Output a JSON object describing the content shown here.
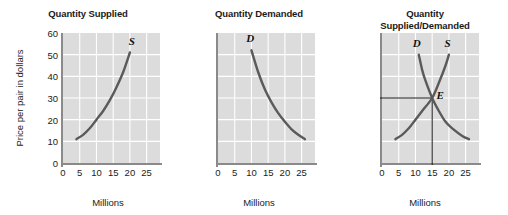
{
  "figure": {
    "background": "#ffffff",
    "plot_background": "#dcdcdc",
    "gridline_color": "#ffffff",
    "curve_color": "#5a5a5a",
    "axis_color": "#8a8a8a",
    "text_color": "#1b1b1b"
  },
  "axes": {
    "ylabel": "Price per pair in dollars",
    "xlabel": "Millions",
    "yticks": [
      "60",
      "50",
      "40",
      "30",
      "20",
      "10",
      "0"
    ],
    "ytick_values": [
      60,
      50,
      40,
      30,
      20,
      10,
      0
    ],
    "xticks": [
      "0",
      "5",
      "10",
      "15",
      "20",
      "25"
    ],
    "xtick_values": [
      0,
      5,
      10,
      15,
      20,
      25
    ],
    "xlim": [
      0,
      29
    ],
    "ylim": [
      0,
      60
    ]
  },
  "panels": [
    {
      "id": "quantity-supplied",
      "title_lines": [
        "Quantity Supplied"
      ],
      "show_yticks": true,
      "show_ylabel": true,
      "curve_labels": [
        {
          "text": "S",
          "x": 20.6,
          "y": 56.5
        }
      ],
      "equilibrium": null
    },
    {
      "id": "quantity-demanded",
      "title_lines": [
        "Quantity Demanded"
      ],
      "show_yticks": false,
      "show_ylabel": false,
      "curve_labels": [
        {
          "text": "D",
          "x": 9.6,
          "y": 57.5
        }
      ],
      "equilibrium": null
    },
    {
      "id": "quantity-supplied-demanded",
      "title_lines": [
        "Quantity",
        "Supplied/Demanded"
      ],
      "show_yticks": false,
      "show_ylabel": false,
      "curve_labels": [
        {
          "text": "D",
          "x": 10.4,
          "y": 55.5
        },
        {
          "text": "S",
          "x": 19.6,
          "y": 55.5
        },
        {
          "text": "E",
          "x": 17.4,
          "y": 31.5
        }
      ],
      "equilibrium": {
        "x": 15,
        "y": 30,
        "label": "E"
      }
    }
  ],
  "chart_data": {
    "type": "line",
    "xlabel": "Millions",
    "ylabel": "Price per pair in dollars",
    "xlim": [
      0,
      29
    ],
    "ylim": [
      0,
      60
    ],
    "xticks": [
      0,
      5,
      10,
      15,
      20,
      25
    ],
    "yticks": [
      0,
      10,
      20,
      30,
      40,
      50,
      60
    ],
    "grid": true,
    "legend": "none",
    "panels": [
      {
        "title": "Quantity Supplied",
        "series": [
          {
            "name": "S",
            "label": "S",
            "type": "supply",
            "points": [
              {
                "x": 4,
                "y": 11
              },
              {
                "x": 6,
                "y": 13
              },
              {
                "x": 8,
                "y": 16
              },
              {
                "x": 10,
                "y": 20
              },
              {
                "x": 12,
                "y": 24
              },
              {
                "x": 14,
                "y": 29
              },
              {
                "x": 16,
                "y": 35
              },
              {
                "x": 18,
                "y": 42
              },
              {
                "x": 20,
                "y": 51
              }
            ]
          }
        ]
      },
      {
        "title": "Quantity Demanded",
        "series": [
          {
            "name": "D",
            "label": "D",
            "type": "demand",
            "points": [
              {
                "x": 10,
                "y": 52
              },
              {
                "x": 12,
                "y": 42
              },
              {
                "x": 14,
                "y": 34
              },
              {
                "x": 16,
                "y": 28
              },
              {
                "x": 18,
                "y": 23
              },
              {
                "x": 20,
                "y": 19
              },
              {
                "x": 22,
                "y": 15.5
              },
              {
                "x": 24,
                "y": 13
              },
              {
                "x": 26,
                "y": 11
              }
            ]
          }
        ]
      },
      {
        "title": "Quantity Supplied/Demanded",
        "series": [
          {
            "name": "D",
            "label": "D",
            "type": "demand",
            "points": [
              {
                "x": 11,
                "y": 50
              },
              {
                "x": 12,
                "y": 43
              },
              {
                "x": 13,
                "y": 38
              },
              {
                "x": 15,
                "y": 30
              },
              {
                "x": 17,
                "y": 24
              },
              {
                "x": 19,
                "y": 19
              },
              {
                "x": 21,
                "y": 16
              },
              {
                "x": 24,
                "y": 12.5
              },
              {
                "x": 26,
                "y": 11
              }
            ]
          },
          {
            "name": "S",
            "label": "S",
            "type": "supply",
            "points": [
              {
                "x": 4,
                "y": 11
              },
              {
                "x": 6,
                "y": 13
              },
              {
                "x": 8,
                "y": 16
              },
              {
                "x": 10,
                "y": 20
              },
              {
                "x": 12,
                "y": 24
              },
              {
                "x": 15,
                "y": 30
              },
              {
                "x": 17,
                "y": 37
              },
              {
                "x": 19,
                "y": 45
              },
              {
                "x": 20,
                "y": 50
              }
            ]
          }
        ],
        "annotations": [
          {
            "label": "E",
            "type": "equilibrium",
            "x": 15,
            "y": 30,
            "guides": [
              "horizontal-to-y-axis",
              "vertical-to-x-axis"
            ]
          }
        ]
      }
    ]
  }
}
